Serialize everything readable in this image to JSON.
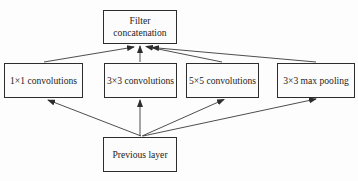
{
  "diagram": {
    "nodes": {
      "filter_concat": {
        "label": "Filter concatenation"
      },
      "conv1": {
        "label": "1×1 convolutions"
      },
      "conv3": {
        "label": "3×3 convolutions"
      },
      "conv5": {
        "label": "5×5 convolutions"
      },
      "maxpool": {
        "label": "3×3 max pooling"
      },
      "prev": {
        "label": "Previous layer"
      }
    },
    "edges": [
      {
        "from": "conv1",
        "to": "filter_concat"
      },
      {
        "from": "conv3",
        "to": "filter_concat"
      },
      {
        "from": "conv5",
        "to": "filter_concat"
      },
      {
        "from": "maxpool",
        "to": "filter_concat"
      },
      {
        "from": "prev",
        "to": "conv1"
      },
      {
        "from": "prev",
        "to": "conv3"
      },
      {
        "from": "prev",
        "to": "conv5"
      },
      {
        "from": "prev",
        "to": "maxpool"
      }
    ],
    "colors": {
      "line": "#3a3a3a",
      "border": "#2d2d2d",
      "text": "#1c1c1c",
      "background": "#fdfdfd"
    }
  }
}
